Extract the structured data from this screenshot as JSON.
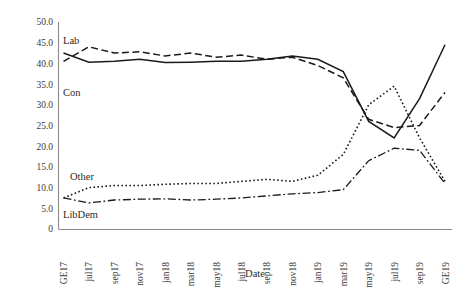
{
  "chart_data": {
    "type": "line",
    "title": "",
    "xlabel": "Date",
    "ylabel": "",
    "grid": false,
    "legend_position": "inline-annotation",
    "ylim": [
      0,
      50
    ],
    "yticks": [
      0,
      5,
      10,
      15,
      20,
      25,
      30,
      35,
      40,
      45,
      50
    ],
    "ytick_labels": [
      "0",
      "5.0",
      "10.0",
      "15.0",
      "20.0",
      "25.0",
      "30.0",
      "35.0",
      "40.0",
      "45.0",
      "50.0"
    ],
    "categories": [
      "GE17",
      "jul17",
      "sep17",
      "nov17",
      "jan18",
      "mar18",
      "may18",
      "jul18",
      "sep18",
      "nov18",
      "jan19",
      "mar19",
      "may19",
      "jul19",
      "sep19",
      "GE19"
    ],
    "series": [
      {
        "name": "Con",
        "style": "solid",
        "values": [
          42.5,
          40.3,
          40.5,
          41.0,
          40.2,
          40.3,
          40.5,
          40.5,
          41.0,
          41.8,
          41.0,
          38.0,
          26.0,
          22.0,
          31.5,
          44.5
        ]
      },
      {
        "name": "Lab",
        "style": "dashed",
        "values": [
          40.5,
          44.0,
          42.5,
          42.8,
          41.8,
          42.5,
          41.5,
          42.0,
          41.0,
          41.5,
          39.5,
          36.5,
          26.5,
          24.5,
          25.0,
          33.0
        ]
      },
      {
        "name": "Other",
        "style": "dotted",
        "values": [
          7.5,
          10.0,
          10.5,
          10.5,
          10.8,
          11.0,
          11.0,
          11.5,
          12.0,
          11.5,
          13.0,
          18.0,
          30.0,
          34.5,
          22.0,
          11.5
        ]
      },
      {
        "name": "LibDem",
        "style": "dash-dot",
        "values": [
          7.5,
          6.3,
          7.0,
          7.2,
          7.3,
          7.0,
          7.2,
          7.5,
          8.0,
          8.5,
          8.8,
          9.5,
          16.5,
          19.5,
          19.0,
          11.0
        ]
      }
    ],
    "annotations": [
      {
        "text": "Lab",
        "series": "Lab"
      },
      {
        "text": "Con",
        "series": "Con"
      },
      {
        "text": "Other",
        "series": "Other"
      },
      {
        "text": "LibDem",
        "series": "LibDem"
      }
    ]
  }
}
